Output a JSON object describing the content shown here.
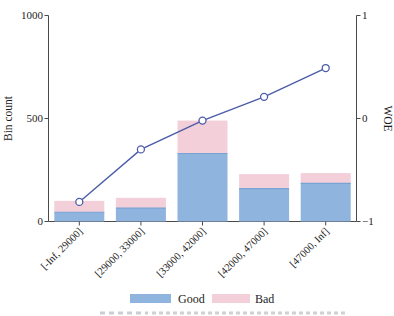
{
  "chart_data": {
    "type": "bar+line",
    "stacked": true,
    "grid": false,
    "categories": [
      "[-Inf, 29000]",
      "[29000, 33000]",
      "[33000, 42000]",
      "[42000, 47000]",
      "[47000, Inf]"
    ],
    "series": [
      {
        "name": "Good",
        "values": [
          45,
          65,
          330,
          160,
          185
        ],
        "color": "#8fb4de",
        "edge_color": "#79a3d4"
      },
      {
        "name": "Bad",
        "values": [
          55,
          50,
          160,
          70,
          50
        ],
        "color": "#f2cfd9",
        "edge_color": "#e8bccb"
      }
    ],
    "line_series": {
      "name": "WOE",
      "values": [
        -0.81,
        -0.3,
        -0.02,
        0.21,
        0.49
      ],
      "color": "#4b5ca8",
      "marker": "open-circle",
      "marker_fill": "#ffffff",
      "axis": "right"
    },
    "ylabel_left": "Bin count",
    "ylabel_right": "WOE",
    "ylim_left": [
      0,
      1000
    ],
    "ylim_right": [
      -1,
      1
    ],
    "left_ticks": [
      0,
      500,
      1000
    ],
    "left_tick_labels": [
      "0",
      "500",
      "1000"
    ],
    "right_ticks": [
      -1,
      0,
      1
    ],
    "right_tick_labels": [
      "−1",
      "0",
      "1"
    ],
    "legend": {
      "position": "bottom-center",
      "entries": [
        {
          "label": "Good"
        },
        {
          "label": "Bad"
        }
      ]
    },
    "colors": {
      "axis": "#4a4a4a",
      "text": "#1c1c1c",
      "background": "#ffffff"
    }
  }
}
